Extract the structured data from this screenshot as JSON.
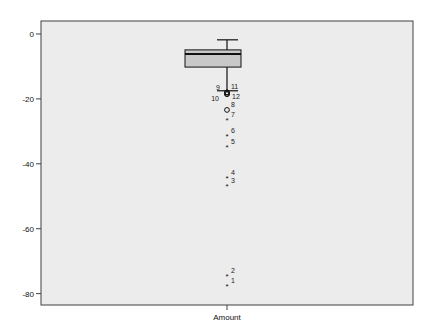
{
  "chart_data": {
    "type": "boxplot",
    "title": "",
    "xlabel": "",
    "ylabel": "",
    "categories": [
      "Amount"
    ],
    "ylim": [
      -83.5,
      4.0
    ],
    "yticks": [
      0,
      -20,
      -40,
      -60,
      -80
    ],
    "ytick_labels": [
      "0",
      "-20",
      "-40",
      "-60",
      "-80"
    ],
    "grid": false,
    "legend": null,
    "box": {
      "category": "Amount",
      "whisker_high": -1.8,
      "q3": -4.9,
      "median": -6.2,
      "q1": -10.2,
      "whisker_low": -17.5
    },
    "outliers": [
      {
        "case": 9,
        "value": -18.0,
        "marker": "circle"
      },
      {
        "case": 11,
        "value": -18.0,
        "marker": "circle"
      },
      {
        "case": 10,
        "value": -18.5,
        "marker": "circle"
      },
      {
        "case": 12,
        "value": -18.5,
        "marker": "circle"
      },
      {
        "case": 8,
        "value": -23.4,
        "marker": "circle"
      },
      {
        "case": 7,
        "value": -26.5,
        "marker": "star"
      },
      {
        "case": 6,
        "value": -31.4,
        "marker": "star"
      },
      {
        "case": 5,
        "value": -34.8,
        "marker": "star"
      },
      {
        "case": 4,
        "value": -44.3,
        "marker": "star"
      },
      {
        "case": 3,
        "value": -46.8,
        "marker": "star"
      },
      {
        "case": 2,
        "value": -74.5,
        "marker": "star"
      },
      {
        "case": 1,
        "value": -77.5,
        "marker": "star"
      }
    ],
    "colors": {
      "plot_background": "#ececec",
      "box_fill": "#c8c8c8",
      "frame": "#404040",
      "lines": "#111111"
    }
  },
  "axis": {
    "x_category_label": "Amount"
  }
}
